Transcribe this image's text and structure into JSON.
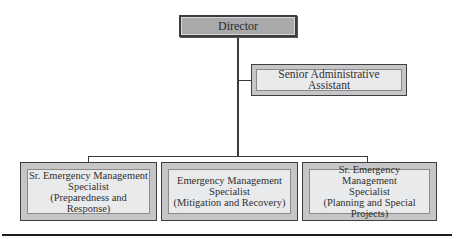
{
  "chart": {
    "nodes": {
      "director": {
        "label": "Director"
      },
      "assistant": {
        "label": "Senior Administrative Assistant"
      },
      "specialists": [
        {
          "label": "Sr. Emergency Management\nSpecialist\n(Preparedness and Response)"
        },
        {
          "label": "Emergency Management\nSpecialist\n(Mitigation and Recovery)"
        },
        {
          "label": "Sr. Emergency Management\nSpecialist\n(Planning and Special\nProjects)"
        }
      ]
    }
  }
}
